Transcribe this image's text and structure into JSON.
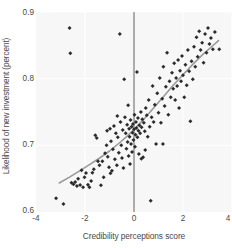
{
  "chart_data": {
    "type": "scatter",
    "title": "",
    "xlabel": "Credibility perceptions score",
    "ylabel": "Likelihood of new investment (percent)",
    "xlim": [
      -4,
      4
    ],
    "ylim": [
      0.6,
      0.9
    ],
    "xticks": [
      -4,
      -2,
      0,
      2,
      4
    ],
    "xticklabels": [
      "-4",
      "-2",
      "0",
      "2",
      "4"
    ],
    "yticks": [
      0.6,
      0.7,
      0.8,
      0.9
    ],
    "yticklabels": [
      "0.6",
      "0.7",
      "0.8",
      "0.9"
    ],
    "grid": true,
    "legend": "none",
    "marker": "diamond",
    "marker_color": "#2b2b2b",
    "plot_bg": "#f7f7f7",
    "gridline_color": "#ffffff",
    "annotations": [
      {
        "type": "vline",
        "x": 0,
        "color": "#6f6f6f",
        "label": "zero-reference-line"
      },
      {
        "type": "fitline",
        "color": "#9a9a9a",
        "label": "smoothed-trend-line"
      }
    ],
    "fit_line": [
      [
        -3.05,
        0.6435
      ],
      [
        -2.6,
        0.653
      ],
      [
        -2.2,
        0.662
      ],
      [
        -1.8,
        0.6715
      ],
      [
        -1.4,
        0.681
      ],
      [
        -1.0,
        0.6915
      ],
      [
        -0.6,
        0.7035
      ],
      [
        -0.3,
        0.713
      ],
      [
        0.0,
        0.7235
      ],
      [
        0.4,
        0.739
      ],
      [
        0.8,
        0.756
      ],
      [
        1.2,
        0.773
      ],
      [
        1.6,
        0.79
      ],
      [
        2.0,
        0.806
      ],
      [
        2.4,
        0.8215
      ],
      [
        2.8,
        0.836
      ],
      [
        3.2,
        0.849
      ],
      [
        3.45,
        0.857
      ]
    ],
    "points": [
      [
        -3.18,
        0.6205
      ],
      [
        -2.88,
        0.612
      ],
      [
        -2.63,
        0.876
      ],
      [
        -2.6,
        0.838
      ],
      [
        -2.55,
        0.644
      ],
      [
        -2.47,
        0.6415
      ],
      [
        -2.4,
        0.645
      ],
      [
        -2.33,
        0.639
      ],
      [
        -2.28,
        0.65
      ],
      [
        -2.2,
        0.6405
      ],
      [
        -2.14,
        0.6625
      ],
      [
        -2.08,
        0.637
      ],
      [
        -2.02,
        0.652
      ],
      [
        -1.96,
        0.6585
      ],
      [
        -1.88,
        0.641
      ],
      [
        -1.82,
        0.637
      ],
      [
        -1.75,
        0.6465
      ],
      [
        -1.7,
        0.659
      ],
      [
        -1.64,
        0.664
      ],
      [
        -1.58,
        0.715
      ],
      [
        -1.52,
        0.711
      ],
      [
        -1.47,
        0.676
      ],
      [
        -1.41,
        0.67
      ],
      [
        -1.35,
        0.64
      ],
      [
        -1.29,
        0.676
      ],
      [
        -1.24,
        0.652
      ],
      [
        -1.18,
        0.688
      ],
      [
        -1.12,
        0.7
      ],
      [
        -1.07,
        0.683
      ],
      [
        -1.02,
        0.667
      ],
      [
        -0.98,
        0.725
      ],
      [
        -0.94,
        0.706
      ],
      [
        -0.9,
        0.662
      ],
      [
        -0.86,
        0.694
      ],
      [
        -0.82,
        0.729
      ],
      [
        -0.78,
        0.679
      ],
      [
        -0.74,
        0.718
      ],
      [
        -0.7,
        0.67
      ],
      [
        -0.66,
        0.712
      ],
      [
        -0.62,
        0.689
      ],
      [
        -0.58,
        0.867
      ],
      [
        -0.55,
        0.735
      ],
      [
        -0.52,
        0.7
      ],
      [
        -0.49,
        0.681
      ],
      [
        -0.46,
        0.723
      ],
      [
        -0.43,
        0.666
      ],
      [
        -0.4,
        0.799
      ],
      [
        -0.37,
        0.742
      ],
      [
        -0.34,
        0.718
      ],
      [
        -0.31,
        0.695
      ],
      [
        -0.28,
        0.731
      ],
      [
        -0.26,
        0.705
      ],
      [
        -0.24,
        0.76
      ],
      [
        -0.22,
        0.684
      ],
      [
        -0.2,
        0.725
      ],
      [
        -0.18,
        0.713
      ],
      [
        -0.16,
        0.672
      ],
      [
        -0.14,
        0.738
      ],
      [
        -0.12,
        0.702
      ],
      [
        -0.1,
        0.728
      ],
      [
        -0.08,
        0.69
      ],
      [
        -0.06,
        0.719
      ],
      [
        -0.04,
        0.732
      ],
      [
        -0.02,
        0.708
      ],
      [
        0.0,
        0.724
      ],
      [
        0.02,
        0.746
      ],
      [
        0.04,
        0.698
      ],
      [
        0.06,
        0.716
      ],
      [
        0.08,
        0.735
      ],
      [
        0.1,
        0.726
      ],
      [
        0.12,
        0.81
      ],
      [
        0.14,
        0.712
      ],
      [
        0.16,
        0.741
      ],
      [
        0.18,
        0.722
      ],
      [
        0.2,
        0.687
      ],
      [
        0.22,
        0.73
      ],
      [
        0.25,
        0.718
      ],
      [
        0.28,
        0.75
      ],
      [
        0.31,
        0.727
      ],
      [
        0.34,
        0.739
      ],
      [
        0.37,
        0.682
      ],
      [
        0.4,
        0.734
      ],
      [
        0.44,
        0.721
      ],
      [
        0.48,
        0.756
      ],
      [
        0.52,
        0.745
      ],
      [
        0.56,
        0.713
      ],
      [
        0.6,
        0.768
      ],
      [
        0.64,
        0.728
      ],
      [
        0.68,
        0.617
      ],
      [
        0.72,
        0.742
      ],
      [
        0.76,
        0.789
      ],
      [
        0.8,
        0.735
      ],
      [
        0.85,
        0.761
      ],
      [
        0.9,
        0.702
      ],
      [
        0.95,
        0.778
      ],
      [
        1.0,
        0.749
      ],
      [
        1.05,
        0.801
      ],
      [
        1.1,
        0.734
      ],
      [
        1.15,
        0.77
      ],
      [
        1.2,
        0.818
      ],
      [
        1.25,
        0.759
      ],
      [
        1.3,
        0.788
      ],
      [
        1.35,
        0.839
      ],
      [
        1.4,
        0.746
      ],
      [
        1.45,
        0.796
      ],
      [
        1.5,
        0.772
      ],
      [
        1.55,
        0.809
      ],
      [
        1.6,
        0.785
      ],
      [
        1.64,
        0.823
      ],
      [
        1.68,
        0.768
      ],
      [
        1.72,
        0.801
      ],
      [
        1.76,
        0.789
      ],
      [
        1.8,
        0.828
      ],
      [
        1.84,
        0.756
      ],
      [
        1.88,
        0.812
      ],
      [
        1.92,
        0.796
      ],
      [
        1.96,
        0.834
      ],
      [
        2.0,
        0.805
      ],
      [
        2.05,
        0.772
      ],
      [
        2.1,
        0.821
      ],
      [
        2.15,
        0.79
      ],
      [
        2.2,
        0.843
      ],
      [
        2.25,
        0.811
      ],
      [
        2.3,
        0.736
      ],
      [
        2.35,
        0.826
      ],
      [
        2.4,
        0.799
      ],
      [
        2.45,
        0.848
      ],
      [
        2.5,
        0.818
      ],
      [
        2.55,
        0.862
      ],
      [
        2.6,
        0.833
      ],
      [
        2.66,
        0.871
      ],
      [
        2.72,
        0.843
      ],
      [
        2.78,
        0.854
      ],
      [
        2.84,
        0.824
      ],
      [
        2.9,
        0.867
      ],
      [
        2.96,
        0.839
      ],
      [
        3.02,
        0.876
      ],
      [
        3.08,
        0.852
      ],
      [
        3.14,
        0.861
      ],
      [
        3.22,
        0.844
      ],
      [
        3.3,
        0.87
      ],
      [
        3.48,
        0.844
      ],
      [
        -1.1,
        0.722
      ],
      [
        -0.96,
        0.658
      ],
      [
        -0.68,
        0.744
      ],
      [
        0.3,
        0.68
      ],
      [
        0.46,
        0.693
      ],
      [
        1.18,
        0.702
      ]
    ]
  }
}
